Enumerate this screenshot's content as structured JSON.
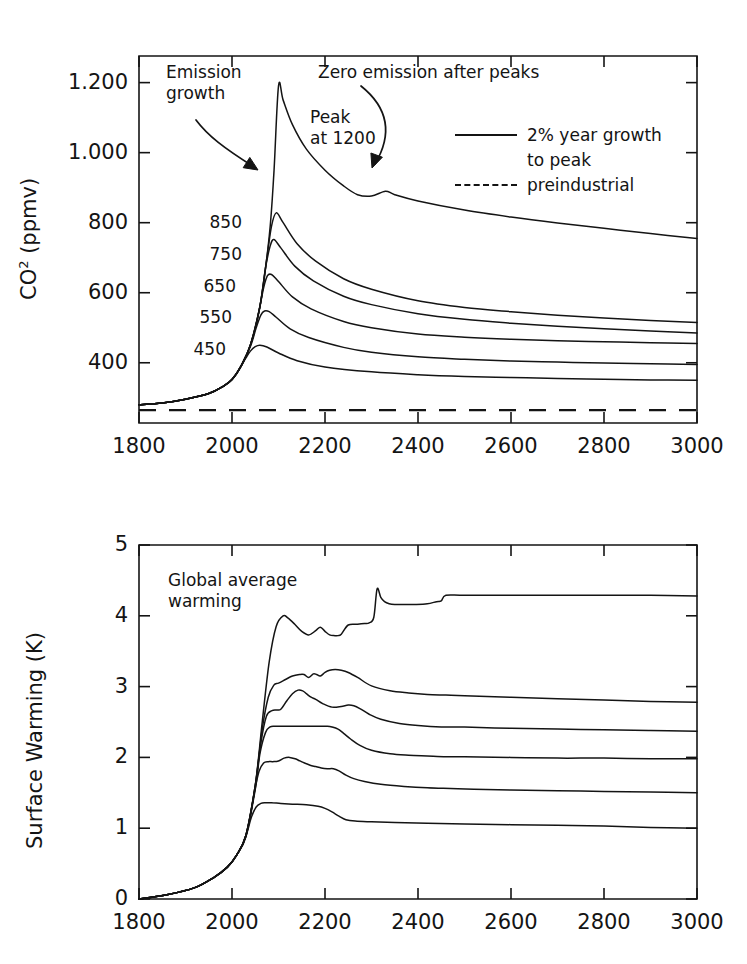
{
  "figure": {
    "crop_artifact_text": "",
    "panels": [
      "co2",
      "warming"
    ]
  },
  "co2_panel": {
    "ylabel_pre": "CO",
    "ylabel_sup": "2",
    "ylabel_post": " (ppmv)",
    "ytick_labels": [
      "1.200",
      "1.000",
      "800",
      "600",
      "400"
    ],
    "xtick_labels": [
      "1800",
      "2000",
      "2200",
      "2400",
      "2600",
      "2800",
      "3000"
    ],
    "annotations": {
      "emission_growth": "Emission\ngrowth",
      "zero_emission": "Zero emission after peaks",
      "peak_at": "Peak\nat 1200"
    },
    "curve_labels": [
      "850",
      "750",
      "650",
      "550",
      "450"
    ],
    "legend": {
      "series_label_line1": "2% year growth",
      "series_label_line2": "to peak",
      "baseline_label": "preindustrial"
    }
  },
  "warming_panel": {
    "ylabel": "Surface Warming (K)",
    "ytick_labels": [
      "5",
      "4",
      "3",
      "2",
      "1",
      "0"
    ],
    "xtick_labels": [
      "1800",
      "2000",
      "2200",
      "2400",
      "2600",
      "2800",
      "3000"
    ],
    "annotations": {
      "global_average_warming": "Global average\nwarming"
    }
  },
  "colors": {
    "line": "#141414",
    "axis": "#141414",
    "background": "#ffffff",
    "text": "#141414"
  },
  "chart_data": [
    {
      "type": "line",
      "id": "co2",
      "title": "",
      "xlabel": "",
      "ylabel": "CO2 (ppmv)",
      "xlim": [
        1800,
        3000
      ],
      "ylim": [
        228,
        1276
      ],
      "xticks": [
        1800,
        2000,
        2200,
        2400,
        2600,
        2800,
        3000
      ],
      "yticks": [
        400,
        600,
        800,
        1000,
        1200
      ],
      "ytick_text": [
        "400",
        "600",
        "800",
        "1.000",
        "1.200"
      ],
      "grid": false,
      "legend_position": "upper-right",
      "legend_entries": [
        "2% year growth to peak",
        "preindustrial"
      ],
      "annotations": [
        {
          "text": "Emission growth",
          "points_to_x": 2045,
          "points_to_y": 660
        },
        {
          "text": "Zero emission after peaks",
          "points_to_x": 2310,
          "points_to_y": 905
        },
        {
          "text": "Peak at 1200",
          "x": 2180,
          "y": 1080
        }
      ],
      "series": [
        {
          "name": "1200",
          "peak_ppmv": 1190,
          "end_ppmv": 755,
          "x": [
            1800,
            1850,
            1900,
            1950,
            1980,
            2000,
            2020,
            2040,
            2060,
            2080,
            2090,
            2100,
            2110,
            2130,
            2160,
            2200,
            2240,
            2270,
            2300,
            2330,
            2350,
            2400,
            2500,
            2600,
            2700,
            2800,
            2900,
            3000
          ],
          "values": [
            280,
            285,
            296,
            312,
            332,
            352,
            392,
            452,
            560,
            760,
            940,
            1190,
            1150,
            1080,
            1010,
            950,
            905,
            880,
            876,
            890,
            880,
            862,
            836,
            816,
            799,
            784,
            769,
            755
          ]
        },
        {
          "name": "850",
          "end_ppmv": 515,
          "x": [
            1800,
            1850,
            1900,
            1950,
            1980,
            2000,
            2020,
            2040,
            2060,
            2075,
            2085,
            2095,
            2110,
            2140,
            2180,
            2240,
            2300,
            2400,
            2500,
            2600,
            2700,
            2800,
            2900,
            3000
          ],
          "values": [
            280,
            285,
            296,
            312,
            332,
            352,
            392,
            452,
            560,
            700,
            790,
            828,
            800,
            740,
            690,
            640,
            610,
            577,
            558,
            546,
            536,
            528,
            521,
            515
          ]
        },
        {
          "name": "750",
          "end_ppmv": 485,
          "x": [
            1800,
            1850,
            1900,
            1950,
            1980,
            2000,
            2020,
            2040,
            2060,
            2072,
            2082,
            2090,
            2105,
            2135,
            2175,
            2240,
            2300,
            2400,
            2500,
            2600,
            2700,
            2800,
            2900,
            3000
          ],
          "values": [
            280,
            285,
            296,
            312,
            332,
            352,
            392,
            452,
            560,
            670,
            733,
            752,
            728,
            676,
            634,
            590,
            566,
            540,
            524,
            513,
            504,
            497,
            491,
            485
          ]
        },
        {
          "name": "650",
          "end_ppmv": 455,
          "x": [
            1800,
            1850,
            1900,
            1950,
            1980,
            2000,
            2020,
            2040,
            2058,
            2068,
            2076,
            2085,
            2100,
            2130,
            2170,
            2240,
            2300,
            2400,
            2500,
            2600,
            2700,
            2800,
            2900,
            3000
          ],
          "values": [
            280,
            285,
            296,
            312,
            332,
            352,
            392,
            452,
            548,
            614,
            648,
            652,
            632,
            588,
            554,
            518,
            500,
            482,
            473,
            467,
            463,
            460,
            457,
            455
          ]
        },
        {
          "name": "550",
          "end_ppmv": 395,
          "x": [
            1800,
            1850,
            1900,
            1950,
            1980,
            2000,
            2020,
            2040,
            2052,
            2062,
            2070,
            2080,
            2095,
            2125,
            2165,
            2240,
            2300,
            2400,
            2500,
            2600,
            2700,
            2800,
            2900,
            3000
          ],
          "values": [
            280,
            285,
            296,
            312,
            332,
            352,
            392,
            448,
            500,
            536,
            548,
            546,
            530,
            497,
            472,
            444,
            430,
            417,
            410,
            405,
            402,
            399,
            397,
            395
          ]
        },
        {
          "name": "450",
          "end_ppmv": 350,
          "x": [
            1800,
            1850,
            1900,
            1950,
            1980,
            2000,
            2015,
            2030,
            2040,
            2050,
            2060,
            2075,
            2100,
            2140,
            2200,
            2300,
            2400,
            2500,
            2600,
            2700,
            2800,
            2900,
            3000
          ],
          "values": [
            280,
            285,
            296,
            312,
            332,
            352,
            380,
            414,
            434,
            446,
            450,
            445,
            428,
            406,
            388,
            374,
            366,
            361,
            358,
            355,
            353,
            351,
            350
          ]
        },
        {
          "name": "preindustrial",
          "style": "dashed",
          "constant_ppmv": 265
        }
      ]
    },
    {
      "type": "line",
      "id": "warming",
      "title": "",
      "xlabel": "",
      "ylabel": "Surface Warming (K)",
      "xlim": [
        1800,
        3000
      ],
      "ylim": [
        0,
        5
      ],
      "xticks": [
        1800,
        2000,
        2200,
        2400,
        2600,
        2800,
        3000
      ],
      "yticks": [
        0,
        1,
        2,
        3,
        4,
        5
      ],
      "grid": false,
      "legend_position": "none",
      "annotations": [
        {
          "text": "Global average warming",
          "x": 1880,
          "y": 4.45
        }
      ],
      "series": [
        {
          "name": "1200",
          "end_k": 4.28,
          "x": [
            1800,
            1860,
            1920,
            1960,
            1990,
            2010,
            2030,
            2050,
            2065,
            2080,
            2095,
            2110,
            2120,
            2135,
            2150,
            2165,
            2180,
            2190,
            2200,
            2210,
            2220,
            2228,
            2235,
            2250,
            2270,
            2285,
            2295,
            2305,
            2312,
            2320,
            2328,
            2338,
            2350,
            2370,
            2395,
            2420,
            2440,
            2450,
            2460,
            2500,
            2600,
            2700,
            2800,
            2900,
            3000
          ],
          "values": [
            0.0,
            0.06,
            0.16,
            0.3,
            0.45,
            0.62,
            0.9,
            1.6,
            2.5,
            3.35,
            3.85,
            4.0,
            3.97,
            3.88,
            3.78,
            3.73,
            3.79,
            3.84,
            3.78,
            3.73,
            3.72,
            3.72,
            3.74,
            3.87,
            3.88,
            3.89,
            3.9,
            3.98,
            4.38,
            4.26,
            4.2,
            4.17,
            4.16,
            4.16,
            4.16,
            4.17,
            4.2,
            4.21,
            4.29,
            4.29,
            4.29,
            4.29,
            4.29,
            4.29,
            4.28
          ]
        },
        {
          "name": "850",
          "end_k": 2.78,
          "x": [
            1800,
            1860,
            1920,
            1960,
            1990,
            2010,
            2030,
            2050,
            2065,
            2078,
            2090,
            2100,
            2115,
            2130,
            2145,
            2155,
            2165,
            2175,
            2182,
            2190,
            2200,
            2210,
            2222,
            2235,
            2250,
            2270,
            2300,
            2340,
            2380,
            2420,
            2460,
            2500,
            2600,
            2700,
            2800,
            2900,
            3000
          ],
          "values": [
            0.0,
            0.06,
            0.16,
            0.3,
            0.45,
            0.62,
            0.9,
            1.6,
            2.4,
            2.85,
            3.02,
            3.05,
            3.1,
            3.15,
            3.17,
            3.17,
            3.13,
            3.18,
            3.17,
            3.15,
            3.2,
            3.23,
            3.24,
            3.23,
            3.2,
            3.13,
            3.01,
            2.94,
            2.91,
            2.89,
            2.88,
            2.87,
            2.85,
            2.83,
            2.81,
            2.79,
            2.78
          ]
        },
        {
          "name": "750",
          "end_k": 2.37,
          "x": [
            1800,
            1860,
            1920,
            1960,
            1990,
            2010,
            2030,
            2050,
            2062,
            2074,
            2086,
            2096,
            2105,
            2118,
            2130,
            2142,
            2152,
            2160,
            2170,
            2180,
            2195,
            2215,
            2235,
            2250,
            2262,
            2275,
            2295,
            2320,
            2360,
            2400,
            2450,
            2500,
            2600,
            2700,
            2800,
            2900,
            3000
          ],
          "values": [
            0.0,
            0.06,
            0.16,
            0.3,
            0.45,
            0.62,
            0.9,
            1.6,
            2.2,
            2.58,
            2.66,
            2.67,
            2.68,
            2.8,
            2.9,
            2.95,
            2.94,
            2.9,
            2.85,
            2.82,
            2.76,
            2.71,
            2.72,
            2.74,
            2.73,
            2.69,
            2.61,
            2.54,
            2.48,
            2.45,
            2.43,
            2.43,
            2.41,
            2.4,
            2.39,
            2.38,
            2.37
          ]
        },
        {
          "name": "650",
          "end_k": 1.98,
          "x": [
            1800,
            1860,
            1920,
            1960,
            1990,
            2010,
            2030,
            2050,
            2060,
            2072,
            2082,
            2092,
            2105,
            2130,
            2160,
            2190,
            2205,
            2215,
            2228,
            2240,
            2255,
            2275,
            2300,
            2340,
            2380,
            2420,
            2460,
            2500,
            2600,
            2700,
            2800,
            2900,
            3000
          ],
          "values": [
            0.0,
            0.06,
            0.16,
            0.3,
            0.45,
            0.62,
            0.9,
            1.55,
            2.05,
            2.35,
            2.43,
            2.44,
            2.44,
            2.44,
            2.44,
            2.44,
            2.44,
            2.43,
            2.4,
            2.34,
            2.26,
            2.17,
            2.1,
            2.05,
            2.03,
            2.02,
            2.01,
            2.01,
            2.0,
            1.99,
            1.99,
            1.98,
            1.98
          ]
        },
        {
          "name": "550",
          "end_k": 1.5,
          "x": [
            1800,
            1860,
            1920,
            1960,
            1990,
            2010,
            2030,
            2048,
            2058,
            2068,
            2078,
            2088,
            2100,
            2112,
            2124,
            2136,
            2146,
            2156,
            2168,
            2180,
            2192,
            2205,
            2218,
            2230,
            2245,
            2262,
            2285,
            2320,
            2370,
            2420,
            2470,
            2520,
            2600,
            2700,
            2800,
            2900,
            3000
          ],
          "values": [
            0.0,
            0.06,
            0.16,
            0.3,
            0.45,
            0.62,
            0.88,
            1.5,
            1.8,
            1.92,
            1.94,
            1.94,
            1.95,
            1.99,
            2.0,
            1.98,
            1.95,
            1.92,
            1.89,
            1.87,
            1.85,
            1.84,
            1.84,
            1.81,
            1.75,
            1.7,
            1.66,
            1.62,
            1.59,
            1.57,
            1.56,
            1.55,
            1.54,
            1.53,
            1.52,
            1.51,
            1.5
          ]
        },
        {
          "name": "450",
          "end_k": 1.0,
          "x": [
            1800,
            1860,
            1920,
            1960,
            1990,
            2010,
            2028,
            2042,
            2052,
            2062,
            2072,
            2085,
            2105,
            2130,
            2160,
            2185,
            2200,
            2215,
            2230,
            2245,
            2265,
            2300,
            2350,
            2420,
            2500,
            2600,
            2700,
            2800,
            2900,
            3000
          ],
          "values": [
            0.0,
            0.06,
            0.16,
            0.3,
            0.45,
            0.62,
            0.85,
            1.16,
            1.3,
            1.35,
            1.36,
            1.36,
            1.35,
            1.34,
            1.33,
            1.31,
            1.28,
            1.23,
            1.17,
            1.12,
            1.1,
            1.09,
            1.08,
            1.07,
            1.06,
            1.05,
            1.04,
            1.03,
            1.01,
            1.0
          ]
        }
      ]
    }
  ]
}
